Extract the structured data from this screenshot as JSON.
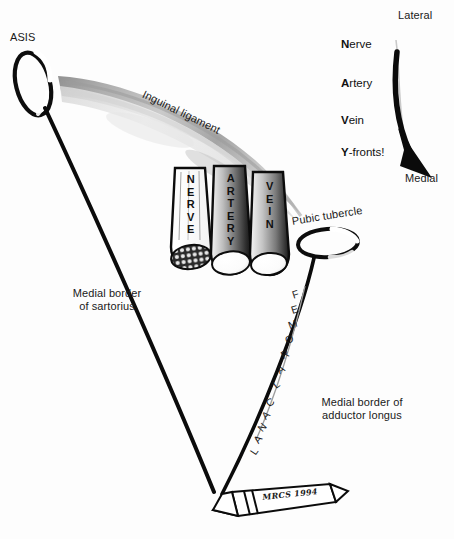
{
  "figure": {
    "background_color": "#fdfdfd",
    "ink_color": "#111111",
    "ligament_color": "#b4b4b4"
  },
  "labels": {
    "asis": "ASIS",
    "inguinal_ligament": "Inguinal ligament",
    "pubic_tubercle": "Pubic tubercle",
    "medial_border_sartorius": "Medial border\nof sartorius",
    "medial_border_adductor": "Medial border of\nadductor longus",
    "lateral": "Lateral",
    "medial": "Medial"
  },
  "structures": {
    "nerve_tube": "N\nE\nR\nV\nE",
    "artery_tube": "A\nR\nT\nE\nR\nY",
    "vein_tube": "V\nE\nI\nN"
  },
  "femoral_canal": {
    "label": "FEMORAL CANAL",
    "letters": [
      "F",
      "E",
      "M",
      "O",
      "R",
      "A",
      "L",
      "C",
      "A",
      "N",
      "A",
      "L"
    ]
  },
  "mnemonic": {
    "heading_hidden": "NAVY",
    "items": [
      {
        "initial": "N",
        "rest": "erve"
      },
      {
        "initial": "A",
        "rest": "rtery"
      },
      {
        "initial": "V",
        "rest": "ein"
      },
      {
        "initial": "Y",
        "rest": "-fronts!"
      }
    ]
  },
  "signature": {
    "text": "MRCS 1994"
  }
}
